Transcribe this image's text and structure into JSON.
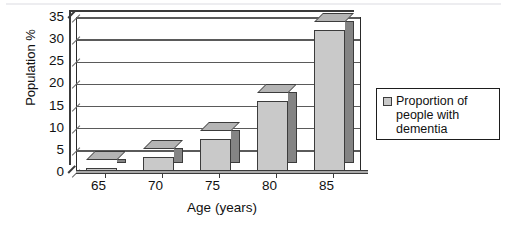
{
  "chart_data": {
    "type": "bar",
    "title": "",
    "subtitle": "",
    "xlabel": "Age (years)",
    "ylabel": "Population %",
    "categories": [
      "65",
      "70",
      "75",
      "80",
      "85"
    ],
    "values": [
      1,
      3.5,
      7.5,
      16,
      32
    ],
    "series": [
      {
        "name": "Proportion of people with dementia",
        "values": [
          1,
          3.5,
          7.5,
          16,
          32
        ]
      }
    ],
    "ylim": [
      0,
      35
    ],
    "ytick_step": 5,
    "yticks": [
      "35",
      "30",
      "25",
      "20",
      "15",
      "10",
      "5",
      "0"
    ],
    "grid": true,
    "grid_axis": "y",
    "legend_position": "right",
    "legend_entries": [
      "Proportion of\npeople with\ndementia"
    ],
    "style": "3d-column",
    "colors": {
      "bar_front": "#c9c9c9",
      "bar_side": "#848484",
      "bar_top": "#b4b4b4",
      "outline": "#3c3c3c",
      "gridline": "#5a5a5a",
      "axis": "#2a2a2a",
      "text": "#111111",
      "background": "#ffffff"
    }
  },
  "legend": {
    "swatch_name": "legend-swatch-proportion",
    "label": "Proportion of\npeople with\ndementia"
  }
}
